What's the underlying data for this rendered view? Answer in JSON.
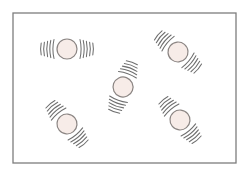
{
  "diagram": {
    "colors": {
      "frame": "#7d7d7d",
      "particle_fill": "#f7ece8",
      "particle_stroke": "#8a8482",
      "vibration_marks": "#6f6f6f",
      "background": "#ffffff"
    },
    "frame": {
      "x": 13,
      "y": 13,
      "width": 223,
      "height": 150
    },
    "particles": [
      {
        "id": "particle-1",
        "cx": 67,
        "cy": 49,
        "r": 10,
        "angle": 0,
        "arcs_per_side": 5
      },
      {
        "id": "particle-2",
        "cx": 178,
        "cy": 52,
        "r": 10,
        "angle": 40,
        "arcs_per_side": 5
      },
      {
        "id": "particle-3",
        "cx": 123,
        "cy": 87,
        "r": 10,
        "angle": -70,
        "arcs_per_side": 5
      },
      {
        "id": "particle-4",
        "cx": 67,
        "cy": 124,
        "r": 10,
        "angle": 50,
        "arcs_per_side": 5
      },
      {
        "id": "particle-5",
        "cx": 180,
        "cy": 120,
        "r": 10,
        "angle": 50,
        "arcs_per_side": 5
      }
    ]
  }
}
